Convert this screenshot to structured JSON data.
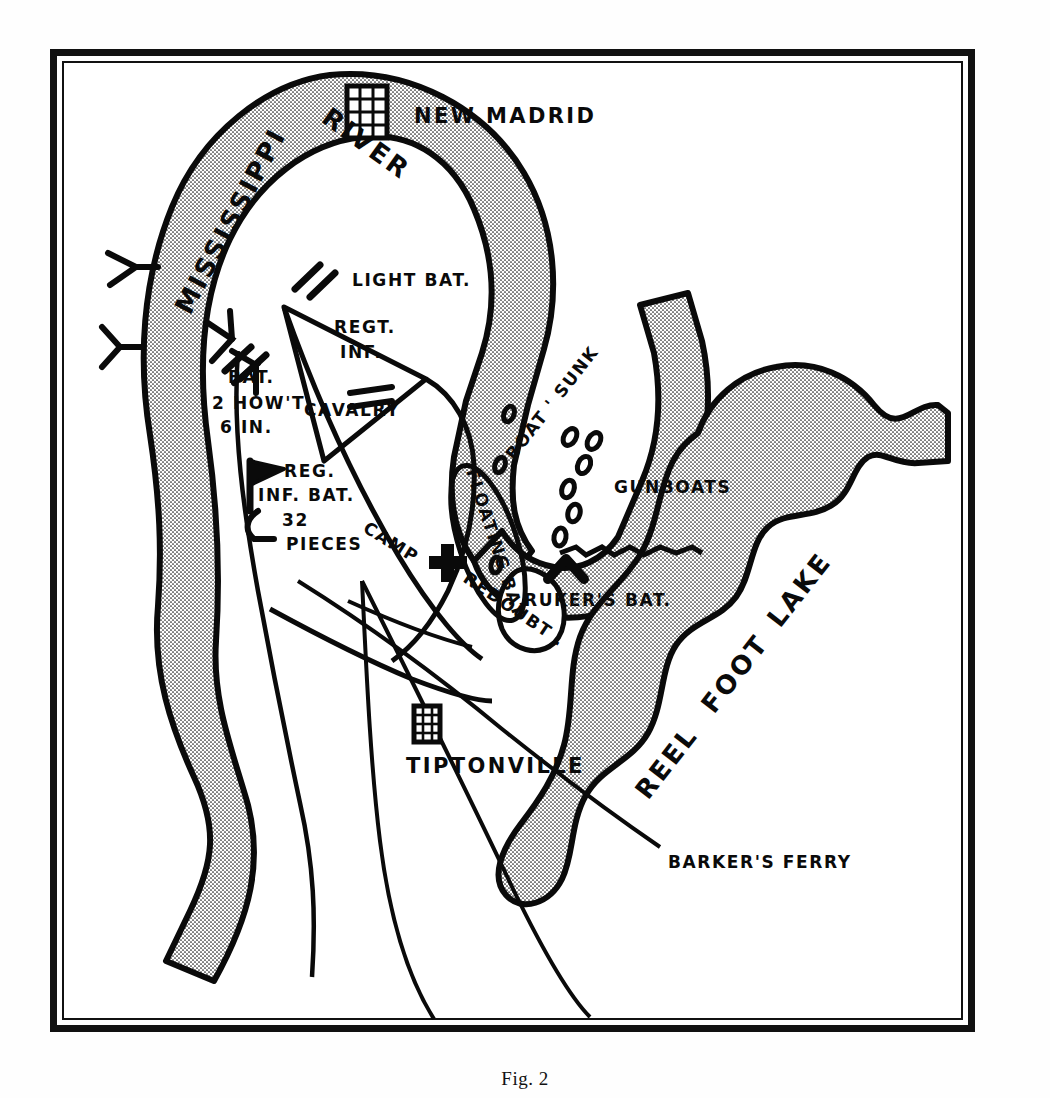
{
  "figure": {
    "caption": "Fig. 2"
  },
  "map": {
    "title": "New Madrid and Island No. 10 Defenses",
    "colors": {
      "ink": "#0a0a0a",
      "paper": "#ffffff",
      "water_stipple": "#111111",
      "frame": "#111111"
    },
    "water_features": [
      {
        "id": "mississippi-river",
        "label_parts": [
          "MISSISSIPPI",
          "RIVER"
        ],
        "label": "MISSISSIPPI RIVER"
      },
      {
        "id": "reel-foot-lake",
        "label_parts": [
          "REEL",
          "FOOT",
          "LAKE"
        ],
        "label": "REEL FOOT LAKE"
      }
    ],
    "settlements": [
      {
        "id": "new-madrid",
        "label": "NEW MADRID",
        "symbol": "town-grid-icon"
      },
      {
        "id": "tiptonville",
        "label": "TIPTONVILLE",
        "symbol": "town-grid-icon"
      }
    ],
    "military_labels": [
      {
        "id": "light-bat",
        "label": "LIGHT BAT.",
        "symbol": "battery-slash-icon"
      },
      {
        "id": "regt-inf",
        "label_lines": [
          "REGT.",
          "INF."
        ],
        "label": "REGT. INF."
      },
      {
        "id": "bat-2-howt-6-in",
        "label_lines": [
          "BAT.",
          "2 HOW'T",
          "6 IN."
        ],
        "label": "BAT. 2 HOW'T 6 IN.",
        "symbol": "battery-slash-icon"
      },
      {
        "id": "cavalry",
        "label": "CAVALRY",
        "symbol": "cavalry-bar-icon"
      },
      {
        "id": "reg-inf-bat-32-pieces",
        "label_lines": [
          "REG.",
          "INF. BAT.",
          "32",
          "PIECES"
        ],
        "label": "REG. INF. BAT. 32 PIECES",
        "symbol": "flag-icon"
      },
      {
        "id": "camp",
        "label": "CAMP",
        "symbol": "camp-cross-icon"
      },
      {
        "id": "redoubt",
        "label": "REDOUBT ."
      },
      {
        "id": "floating-bat",
        "label": "FLOATING BAT."
      },
      {
        "id": "boat-sunk",
        "label": "BOAT ' SUNK"
      },
      {
        "id": "gunboats",
        "label": "GUNBOATS",
        "symbol": "gunboat-oval-icon"
      },
      {
        "id": "rukers-bat",
        "label": "RUKER'S BAT.",
        "symbol": "chevron-battery-icon"
      }
    ],
    "other_labels": [
      {
        "id": "barkers-ferry",
        "label": "BARKER'S FERRY"
      }
    ]
  }
}
